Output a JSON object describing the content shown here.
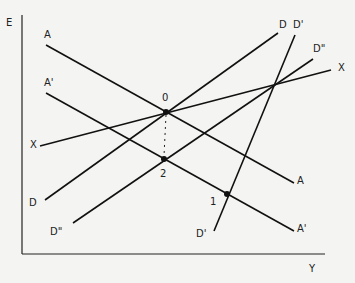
{
  "diagram": {
    "type": "economics-line-diagram",
    "colors": {
      "background": "#f4f4f2",
      "lines": "#111111"
    },
    "axes": {
      "y_label": "E",
      "x_label": "Y",
      "y_axis": {
        "x1": 22,
        "y1": 15,
        "x2": 22,
        "y2": 254
      },
      "x_axis": {
        "x1": 22,
        "y1": 254,
        "x2": 325,
        "y2": 254
      },
      "y_label_pos": {
        "x": 6,
        "y": 26
      },
      "x_label_pos": {
        "x": 309,
        "y": 272
      }
    },
    "lines": [
      {
        "id": "A",
        "x1": 46,
        "y1": 45,
        "x2": 294,
        "y2": 183,
        "labels": [
          {
            "text": "A",
            "x": 44,
            "y": 38
          },
          {
            "text": "A",
            "x": 297,
            "y": 184
          }
        ]
      },
      {
        "id": "A-prime",
        "x1": 46,
        "y1": 93,
        "x2": 294,
        "y2": 231,
        "labels": [
          {
            "text": "A'",
            "x": 44,
            "y": 86
          },
          {
            "text": "A'",
            "x": 297,
            "y": 232
          }
        ]
      },
      {
        "id": "X",
        "x1": 40,
        "y1": 146,
        "x2": 331,
        "y2": 70,
        "labels": [
          {
            "text": "X",
            "x": 30,
            "y": 148
          },
          {
            "text": "X",
            "x": 338,
            "y": 71
          }
        ]
      },
      {
        "id": "D",
        "x1": 45,
        "y1": 200,
        "x2": 278,
        "y2": 33,
        "labels": [
          {
            "text": "D",
            "x": 29,
            "y": 206
          },
          {
            "text": "D",
            "x": 279,
            "y": 28
          }
        ]
      },
      {
        "id": "D-prime",
        "x1": 214,
        "y1": 231,
        "x2": 295,
        "y2": 35,
        "labels": [
          {
            "text": "D'",
            "x": 196,
            "y": 237
          },
          {
            "text": "D'",
            "x": 293,
            "y": 28
          }
        ]
      },
      {
        "id": "D-double-prime",
        "x1": 73,
        "y1": 223,
        "x2": 313,
        "y2": 59,
        "labels": [
          {
            "text": "D\"",
            "x": 50,
            "y": 235
          },
          {
            "text": "D\"",
            "x": 313,
            "y": 52
          }
        ]
      }
    ],
    "points": [
      {
        "id": "0",
        "label": "0",
        "x": 166,
        "y": 112,
        "label_x": 162,
        "label_y": 101
      },
      {
        "id": "2",
        "label": "2",
        "x": 164,
        "y": 159,
        "label_x": 160,
        "label_y": 177
      },
      {
        "id": "1",
        "label": "1",
        "x": 227,
        "y": 194,
        "label_x": 210,
        "label_y": 205
      }
    ],
    "dotted_guides": [
      {
        "from": "0",
        "to": "2",
        "x1": 166,
        "y1": 115,
        "x2": 164,
        "y2": 156
      }
    ]
  }
}
